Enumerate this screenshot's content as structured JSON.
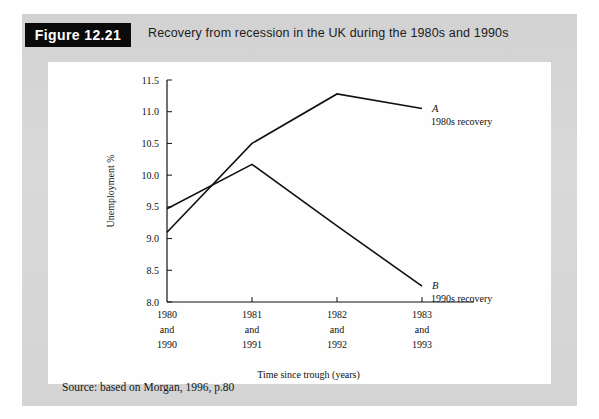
{
  "figure": {
    "badge": "Figure 12.21",
    "title": "Recovery from recession in the UK during the 1980s and 1990s",
    "source": "Source: based on Morgan, 1996, p.80"
  },
  "chart_data": {
    "type": "line",
    "title": "Recovery from recession in the UK during the 1980s and 1990s",
    "xlabel": "Time since trough (years)",
    "ylabel": "Unemployment %",
    "ylim": [
      8.0,
      11.5
    ],
    "yticks": [
      "8.0",
      "8.5",
      "9.0",
      "9.5",
      "10.0",
      "10.5",
      "11.0",
      "11.5"
    ],
    "ytick_values": [
      8.0,
      8.5,
      9.0,
      9.5,
      10.0,
      10.5,
      11.0,
      11.5
    ],
    "grid": false,
    "legend_position": "inline-right",
    "categories": [
      "1980\nand\n1990",
      "1981\nand\n1991",
      "1982\nand\n1992",
      "1983\nand\n1993"
    ],
    "xtick_lines": [
      [
        "1980",
        "and",
        "1990"
      ],
      [
        "1981",
        "and",
        "1991"
      ],
      [
        "1982",
        "and",
        "1992"
      ],
      [
        "1983",
        "and",
        "1993"
      ]
    ],
    "series": [
      {
        "name": "A",
        "label": "1980s recovery",
        "values": [
          9.1,
          10.5,
          11.28,
          11.05
        ]
      },
      {
        "name": "B",
        "label": "1990s recovery",
        "values": [
          9.47,
          10.17,
          9.2,
          8.25
        ]
      }
    ],
    "line_color": "#111111"
  },
  "annotations": {
    "a_letter": "A",
    "a_text": "1980s recovery",
    "b_letter": "B",
    "b_text": "1990s recovery"
  }
}
